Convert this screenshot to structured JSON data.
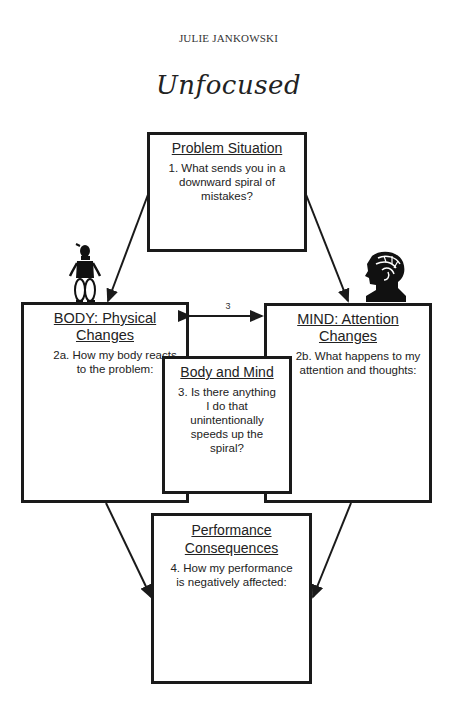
{
  "header": {
    "author": "JULIE JANKOWSKI",
    "title": "Unfocused"
  },
  "diagram": {
    "problem": {
      "heading": "Problem Situation",
      "prompt": "1. What sends you in a downward spiral of mistakes?"
    },
    "body": {
      "heading": "BODY: Physical Changes",
      "prompt": "2a. How my body reacts to the problem:",
      "icon": "person-figure-icon"
    },
    "mind": {
      "heading": "MIND: Attention Changes",
      "prompt": "2b. What happens to my attention and thoughts:",
      "icon": "head-brain-icon"
    },
    "body_and_mind": {
      "heading": "Body and Mind",
      "prompt": "3. Is there anything I do that unintentionally speeds up the spiral?",
      "arrow_label": "3"
    },
    "performance": {
      "heading_line1": "Performance",
      "heading_line2": "Consequences",
      "prompt": "4.  How my performance is negatively affected:"
    }
  }
}
